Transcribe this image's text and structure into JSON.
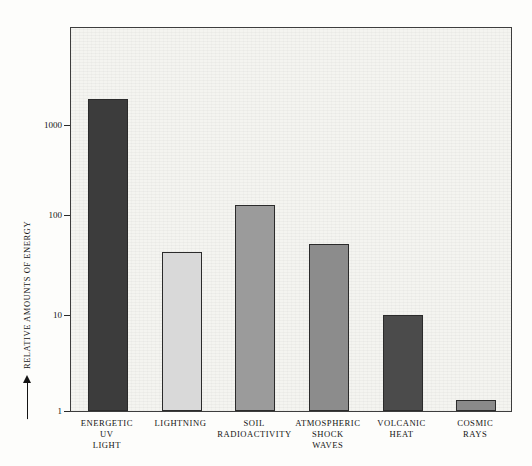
{
  "chart_data": {
    "type": "bar",
    "title": "",
    "subtitle": "",
    "xlabel": "",
    "ylabel": "RELATIVE AMOUNTS OF ENERGY",
    "ylabel_has_arrow": true,
    "yscale": "log",
    "ylim": [
      1,
      3000
    ],
    "ytick_labels": [
      "1000",
      "100",
      "10",
      "1"
    ],
    "ytick_values": [
      1000,
      100,
      10,
      1
    ],
    "grid": false,
    "legend": null,
    "categories": [
      "ENERGETIC UV LIGHT",
      "LIGHTNING",
      "SOIL RADIOACTIVITY",
      "ATMOSPHERIC SHOCK WAVES",
      "VOLCANIC HEAT",
      "COSMIC RAYS"
    ],
    "category_lines": [
      [
        "ENERGETIC",
        "UV",
        "LIGHT"
      ],
      [
        "LIGHTNING"
      ],
      [
        "SOIL",
        "RADIOACTIVITY"
      ],
      [
        "ATMOSPHERIC",
        "SHOCK",
        "WAVES"
      ],
      [
        "VOLCANIC",
        "HEAT"
      ],
      [
        "COSMIC",
        "RAYS"
      ]
    ],
    "values": [
      1800,
      45,
      140,
      55,
      10,
      1.3
    ],
    "bar_colors": [
      "#3c3c3c",
      "#d9d9d9",
      "#9b9b9b",
      "#8c8c8c",
      "#4b4b4b",
      "#8a8a8a"
    ],
    "bar_edge_color": "#2b2b2b",
    "plot_background": "#f4f4f0",
    "frame_color": "#3d3d3d",
    "text_color": "#141414"
  },
  "figure": {
    "plot_left_px": 70,
    "plot_top_px": 27,
    "plot_width_px": 442,
    "plot_height_px": 385
  }
}
